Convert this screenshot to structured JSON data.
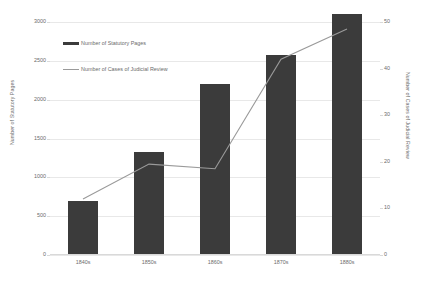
{
  "chart_data": {
    "type": "bar",
    "title": "",
    "subtitle": "",
    "xlabel": "",
    "ylabel": "Number of Statutory Pages",
    "y2label": "Number of Cases of Judicial Review",
    "categories": [
      "1840s",
      "1850s",
      "1860s",
      "1870s",
      "1880s"
    ],
    "ylim": [
      0,
      3000
    ],
    "y2lim": [
      0,
      50
    ],
    "yticks": [
      0,
      500,
      1000,
      1500,
      2000,
      2500,
      3000
    ],
    "y2ticks": [
      0,
      10,
      20,
      30,
      40,
      50
    ],
    "grid": true,
    "legend_position": "upper-left-inside",
    "series": [
      {
        "name": "Number of Statutory Pages",
        "type": "bar",
        "axis": "left",
        "color": "#3b3b3b",
        "values": [
          700,
          1330,
          2200,
          2580,
          3110
        ]
      },
      {
        "name": "Number of Cases of Judicial Review",
        "type": "line",
        "axis": "right",
        "color": "#9a9a9a",
        "values": [
          12,
          19.5,
          18.5,
          42,
          48.5
        ]
      }
    ]
  },
  "legend": {
    "items": [
      {
        "label": "Number of Statutory Pages",
        "marker": "bar-swatch"
      },
      {
        "label": "Number of Cases of Judicial Review",
        "marker": "line-swatch"
      }
    ]
  },
  "axes": {
    "left": {
      "title": "Number of Statutory Pages",
      "ticks": [
        "3000",
        "2500",
        "2000",
        "1500",
        "1000",
        "500",
        "0"
      ]
    },
    "right": {
      "title": "Number of Cases of Judicial Review",
      "ticks": [
        "50",
        "40",
        "30",
        "20",
        "10",
        "0"
      ]
    },
    "bottom": {
      "ticks": [
        "1840s",
        "1850s",
        "1860s",
        "1870s",
        "1880s"
      ]
    }
  },
  "colors": {
    "bar": "#3b3b3b",
    "line": "#9a9a9a",
    "gridline": "#e8e8e8",
    "text": "#6b6b6b",
    "background": "#ffffff"
  }
}
